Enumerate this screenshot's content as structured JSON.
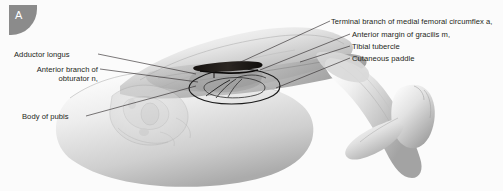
{
  "figure": {
    "panel_letter": "A",
    "background_color": "#fbfbfb",
    "badge_color": "#8b8b8b",
    "leader_line_color": "#231f20",
    "text_color": "#231f20",
    "illustration_type": "grayscale medical anatomical illustration"
  },
  "labels": {
    "left": [
      {
        "id": "adductor-longus",
        "text": "Adductor longus"
      },
      {
        "id": "anterior-branch-obturator",
        "line1": "Anterior branch of",
        "line2": "obturator n,"
      },
      {
        "id": "body-of-pubis",
        "text": "Body of pubis"
      }
    ],
    "right": [
      {
        "id": "terminal-branch-medial-femoral-circumflex",
        "text": "Terminal branch of medial femoral circumflex a,"
      },
      {
        "id": "anterior-margin-gracilis",
        "text": "Anterior margin of gracilis m,"
      },
      {
        "id": "tibial-tubercle",
        "text": "Tibial tubercle"
      },
      {
        "id": "cutaneous-paddle",
        "text": "Cutaneous paddle"
      }
    ]
  },
  "anatomy": {
    "structures": [
      "thigh soft tissue",
      "pelvis bone ghosted overlay",
      "lower leg and foot",
      "surgical retractor bar",
      "skin paddle oval outline",
      "neurovascular pedicle"
    ]
  }
}
